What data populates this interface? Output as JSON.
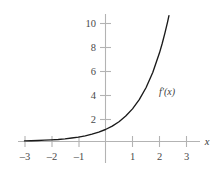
{
  "chart_data": {
    "type": "line",
    "title": "",
    "subtitle": "",
    "xlabel": "x",
    "ylabel": "",
    "xlim": [
      -3.25,
      3.3
    ],
    "ylim": [
      -0.9,
      10.8
    ],
    "grid": false,
    "legend_position": "inline-annotation",
    "x_ticks": [
      -3,
      -2,
      -1,
      1,
      2,
      3
    ],
    "x_tick_labels": [
      "–3",
      "–2",
      "–1",
      "1",
      "2",
      "3"
    ],
    "y_ticks": [
      2,
      4,
      6,
      8,
      10
    ],
    "y_tick_labels": [
      "2",
      "4",
      "6",
      "8",
      "10"
    ],
    "series": [
      {
        "name": "f′(x)",
        "annotation": "f′(x)",
        "annotation_x": 2.0,
        "annotation_y": 4.1,
        "x": [
          -3.0,
          -2.75,
          -2.5,
          -2.25,
          -2.0,
          -1.75,
          -1.5,
          -1.25,
          -1.0,
          -0.75,
          -0.5,
          -0.25,
          0.0,
          0.25,
          0.5,
          0.75,
          1.0,
          1.25,
          1.5,
          1.75,
          2.0,
          2.1,
          2.2,
          2.3,
          2.35
        ],
        "values": [
          0.05,
          0.06,
          0.08,
          0.11,
          0.14,
          0.17,
          0.22,
          0.29,
          0.37,
          0.47,
          0.61,
          0.78,
          1.0,
          1.28,
          1.65,
          2.12,
          2.72,
          3.49,
          4.48,
          5.75,
          7.39,
          8.17,
          9.03,
          9.97,
          10.49
        ]
      }
    ]
  },
  "labels": {
    "x_axis_name": "x",
    "curve_annotation": "f′(x)",
    "y_2": "2",
    "y_4": "4",
    "y_6": "6",
    "y_8": "8",
    "y_10": "10",
    "x_neg3": "–3",
    "x_neg2": "–2",
    "x_neg1": "–1",
    "x_1": "1",
    "x_2": "2",
    "x_3": "3"
  },
  "colors": {
    "background": "#ffffff",
    "axis": "#b3b3b3",
    "curve": "#1a1a1a",
    "tick_text": "#4a4a4a"
  }
}
